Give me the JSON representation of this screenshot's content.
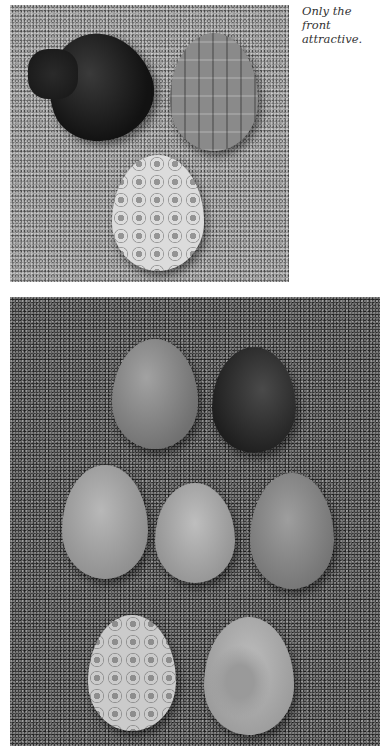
{
  "caption": {
    "text": "Only the front\nattractive."
  },
  "photos": {
    "top": {
      "description": "Three decorated eggs on textured surface",
      "eggs": [
        {
          "name": "dark-stitched-egg",
          "tone": "#1e1e1e"
        },
        {
          "name": "tile-pattern-egg",
          "tone": "#8a8a8a"
        },
        {
          "name": "lace-pattern-egg",
          "tone": "#d8d8d8"
        }
      ]
    },
    "bottom": {
      "description": "Seven eggs in three rows on dark textured surface",
      "eggs": [
        {
          "name": "speckled-egg",
          "tone": "#8c8c8c"
        },
        {
          "name": "dark-egg",
          "tone": "#2a2a2a"
        },
        {
          "name": "plain-egg-left",
          "tone": "#a8a8a8"
        },
        {
          "name": "plain-egg-middle",
          "tone": "#b0b0b0"
        },
        {
          "name": "plain-egg-right",
          "tone": "#8e8e8e"
        },
        {
          "name": "circle-pattern-egg",
          "tone": "#c8c8c8"
        },
        {
          "name": "floral-pattern-egg",
          "tone": "#b4b4b4"
        }
      ]
    }
  }
}
